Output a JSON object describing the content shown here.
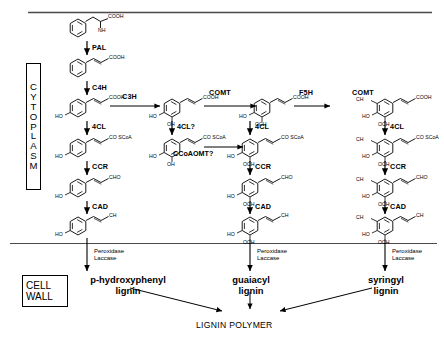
{
  "figure": {
    "compartments": {
      "cytoplasm_label": "CYTOPLASM",
      "cytoplasm_letters": [
        "C",
        "Y",
        "T",
        "O",
        "P",
        "L",
        "A",
        "S",
        "M"
      ],
      "cell_wall_line1": "CELL",
      "cell_wall_line2": "WALL"
    },
    "enzymes": {
      "pal": "PAL",
      "c4h": "C4H",
      "c3h": "C3H",
      "comt_1": "COMT",
      "f5h": "F5H",
      "comt_2": "COMT",
      "cl4_col1": "4CL",
      "cl4_col2_q": "4CL?",
      "cl4_col3": "4CL",
      "cl4_col4": "4CL",
      "ccoaomt": "CCoAOMT?",
      "ccr_col1": "CCR",
      "ccr_col3": "CCR",
      "ccr_col4": "CCR",
      "cad_col1": "CAD",
      "cad_col3": "CAD",
      "cad_col4": "CAD",
      "peroxidase": "Peroxidase",
      "laccase": "Laccase"
    },
    "products": {
      "p_hydroxyphenyl_line1": "p-hydroxyphenyl",
      "p_hydroxyphenyl_line2": "lignin",
      "guaiacyl_line1": "guaiacyl",
      "guaiacyl_line2": "lignin",
      "syringyl_line1": "syringyl",
      "syringyl_line2": "lignin",
      "lignin_polymer": "LIGNIN POLYMER"
    },
    "chemical_groups": {
      "cooh": "COOH",
      "nh2": "NH",
      "nh2_sub": "2",
      "ho": "HO",
      "oh": "OH",
      "och3": "OCH",
      "och3_sub": "3",
      "co_scoa": "CO SCoA",
      "cho": "CHO",
      "ch2oh": "CH",
      "ch2oh_sub": "2",
      "ch2oh_tail": "OH",
      "ch3o": "CH",
      "ch3o_sub": "3",
      "ch3o_tail": "O"
    },
    "colors": {
      "ink": "#000000",
      "background": "#ffffff",
      "rule": "#555555"
    }
  }
}
